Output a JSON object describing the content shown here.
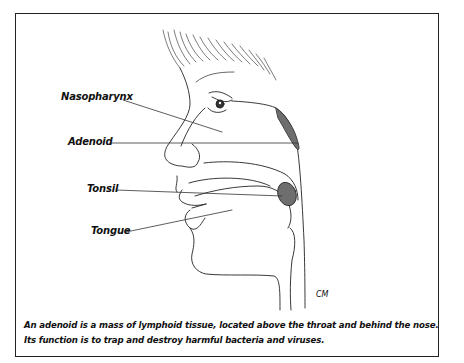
{
  "diagram": {
    "labels": {
      "nasopharynx": "Nasopharynx",
      "adenoid": "Adenoid",
      "tonsil": "Tonsil",
      "tongue": "Tongue"
    },
    "signature": "CM",
    "caption": {
      "line1": "An adenoid is a mass of lymphoid tissue, located above the throat and behind the nose.",
      "line2": "Its function is to trap and destroy harmful bacteria and viruses."
    },
    "colors": {
      "line": "#222222",
      "tissue_fill": "#6e6e6e"
    }
  }
}
